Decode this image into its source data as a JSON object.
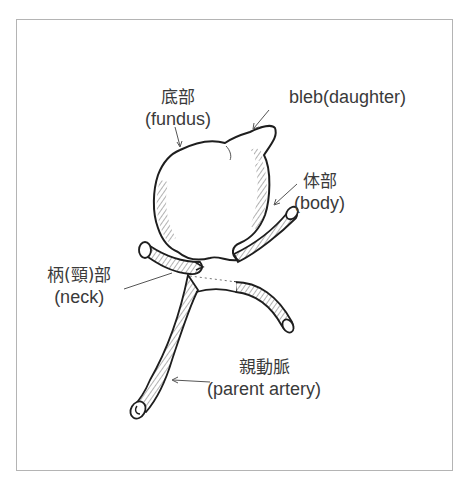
{
  "figure": {
    "top_caption_cropped": "",
    "frame_color": "#b4b4b4",
    "line_color": "#222222",
    "hatch_color": "#555555",
    "labels": [
      {
        "id": "fundus",
        "jp": "底部",
        "en": "(fundus)"
      },
      {
        "id": "bleb",
        "jp": "",
        "en": "bleb(daughter)"
      },
      {
        "id": "body",
        "jp": "体部",
        "en": "(body)"
      },
      {
        "id": "neck",
        "jp": "柄(頸)部",
        "en": "(neck)"
      },
      {
        "id": "parent-artery",
        "jp": "親動脈",
        "en": "(parent artery)"
      }
    ]
  }
}
